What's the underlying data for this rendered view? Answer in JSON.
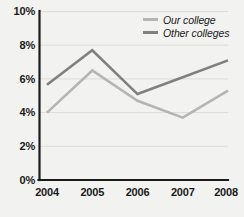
{
  "chart_data": {
    "type": "line",
    "title": "",
    "xlabel": "",
    "ylabel": "",
    "categories": [
      "2004",
      "2005",
      "2006",
      "2007",
      "2008"
    ],
    "ylim": [
      0,
      10
    ],
    "y_ticks": [
      "0%",
      "2%",
      "4%",
      "6%",
      "8%",
      "10%"
    ],
    "y_tick_values": [
      0,
      2,
      4,
      6,
      8,
      10
    ],
    "grid": true,
    "legend_position": "top-right",
    "series": [
      {
        "name": "Our college",
        "color": "#b5b5b5",
        "values": [
          4.0,
          6.5,
          4.7,
          3.7,
          5.3
        ]
      },
      {
        "name": "Other colleges",
        "color": "#808080",
        "values": [
          5.65,
          7.7,
          5.1,
          6.1,
          7.1
        ]
      }
    ]
  },
  "legend": {
    "items": [
      {
        "label": "Our college",
        "swatch": "legend-swatch-our-college"
      },
      {
        "label": "Other colleges",
        "swatch": "legend-swatch-other-colleges"
      }
    ]
  },
  "axes": {
    "y_ticks": [
      "10%",
      "8%",
      "6%",
      "4%",
      "2%",
      "0%"
    ],
    "x_ticks": [
      "2004",
      "2005",
      "2006",
      "2007",
      "2008"
    ]
  },
  "colors": {
    "background": "#f2f2f0",
    "axis": "#1a1a1a",
    "grid": "#dcdcda",
    "series_our_college": "#b5b5b5",
    "series_other_colleges": "#808080",
    "text": "#1a1a1a"
  }
}
